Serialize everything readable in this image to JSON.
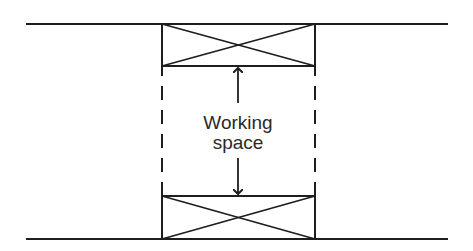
{
  "diagram": {
    "label_line1": "Working",
    "label_line2": "space",
    "stroke_color": "#1e1e1e",
    "text_color": "#2a2a2a",
    "background": "#ffffff",
    "elements": {
      "top_boundary_line": {
        "x1": 26,
        "x2": 448,
        "y": 24
      },
      "bottom_boundary_line": {
        "x1": 26,
        "x2": 448,
        "y": 239
      },
      "top_box": {
        "x": 162,
        "y": 24,
        "width": 153,
        "height": 42,
        "cross": true
      },
      "bottom_box": {
        "x": 162,
        "y": 196,
        "width": 153,
        "height": 43,
        "cross": true
      },
      "left_dashed_line": {
        "x": 162,
        "y1": 66,
        "y2": 196
      },
      "right_dashed_line": {
        "x": 315,
        "y1": 66,
        "y2": 196
      },
      "up_arrow": {
        "x": 238,
        "y_from": 103,
        "y_to": 66
      },
      "down_arrow": {
        "x": 238,
        "y_from": 158,
        "y_to": 196
      }
    }
  }
}
